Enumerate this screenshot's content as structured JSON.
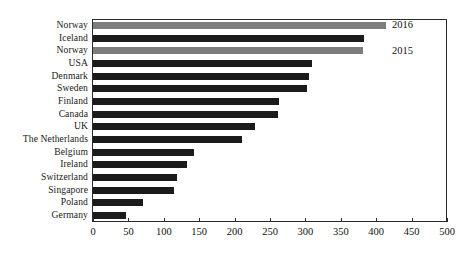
{
  "chart_data": {
    "type": "bar",
    "orientation": "horizontal",
    "title": "",
    "subtitle": "",
    "xlabel": "",
    "ylabel": "",
    "xlim": [
      0,
      500
    ],
    "xticks": [
      0,
      50,
      100,
      150,
      200,
      250,
      300,
      350,
      400,
      450,
      500
    ],
    "xtick_labels": [
      "0",
      "50",
      "100",
      "150",
      "200",
      "250",
      "300",
      "350",
      "400",
      "450",
      "500"
    ],
    "grid": false,
    "legend_position": "top-right-inside",
    "categories": [
      "Norway",
      "Iceland",
      "Norway",
      "USA",
      "Denmark",
      "Sweden",
      "Finland",
      "Canada",
      "UK",
      "The Netherlands",
      "Belgium",
      "Ireland",
      "Switzerland",
      "Singapore",
      "Poland",
      "Germany"
    ],
    "values": [
      414,
      383,
      381,
      309,
      305,
      302,
      263,
      261,
      229,
      210,
      142,
      133,
      118,
      114,
      70,
      46
    ],
    "bar_series": [
      "2016",
      "other",
      "2015",
      "other",
      "other",
      "other",
      "other",
      "other",
      "other",
      "other",
      "other",
      "other",
      "other",
      "other",
      "other",
      "other"
    ],
    "legend": [
      {
        "label": "2016",
        "color": "#7d7d7d"
      },
      {
        "label": "2015",
        "color": "#7d7d7d"
      }
    ],
    "colors": {
      "highlight": "#7d7d7d",
      "default": "#1b1b1b",
      "axis": "#2b2b2b",
      "background": "#ffffff"
    }
  }
}
